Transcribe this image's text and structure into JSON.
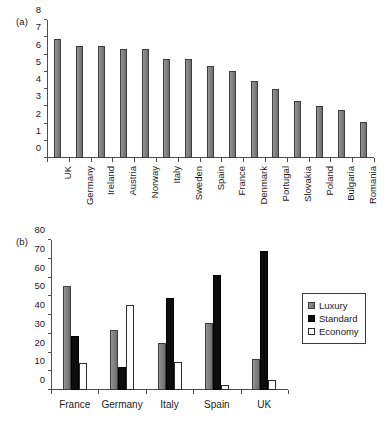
{
  "figure": {
    "background": "#ffffff",
    "bar_gray": "#808080",
    "bar_black": "#0d0d0d",
    "bar_white": "#ffffff",
    "axis_color": "#4d4d4d"
  },
  "panel_a": {
    "tag": "(a)"
  },
  "panel_b": {
    "tag": "(b)"
  },
  "legend": {
    "position": "right",
    "entries": [
      {
        "label": "Luxury",
        "color": "#808080"
      },
      {
        "label": "Standard",
        "color": "#0d0d0d"
      },
      {
        "label": "Economy",
        "color": "#ffffff"
      }
    ]
  },
  "chart_data": [
    {
      "id": "panel-a",
      "type": "bar",
      "title": "(a)",
      "xlabel": "",
      "ylabel": "",
      "ylim": [
        0,
        8
      ],
      "yticks": [
        0,
        1,
        2,
        3,
        4,
        5,
        6,
        7,
        8
      ],
      "ytick_labels": [
        "0",
        "1",
        "2",
        "3",
        "4",
        "5",
        "6",
        "7",
        "8"
      ],
      "grid": false,
      "legend": false,
      "label_rotation": -90,
      "categories": [
        "UK",
        "Germany",
        "Ireland",
        "Austria",
        "Norway",
        "Italy",
        "Sweden",
        "Spain",
        "France",
        "Denmark",
        "Portugal",
        "Slovakia",
        "Poland",
        "Bulgaria",
        "Romania"
      ],
      "values": [
        6.9,
        6.5,
        6.5,
        6.3,
        6.3,
        5.75,
        5.75,
        5.35,
        5.05,
        4.45,
        4.0,
        3.3,
        3.0,
        2.8,
        2.1
      ]
    },
    {
      "id": "panel-b",
      "type": "bar",
      "title": "(b)",
      "xlabel": "",
      "ylabel": "",
      "ylim": [
        0,
        80
      ],
      "yticks": [
        0,
        10,
        20,
        30,
        40,
        50,
        60,
        70,
        80
      ],
      "ytick_labels": [
        "0",
        "10",
        "20",
        "30",
        "40",
        "50",
        "60",
        "70",
        "80"
      ],
      "grid": false,
      "legend": true,
      "legend_position": "right",
      "categories": [
        "France",
        "Germany",
        "Italy",
        "Spain",
        "UK"
      ],
      "series": [
        {
          "name": "Luxury",
          "color": "#808080",
          "values": [
            55.5,
            32.0,
            25.3,
            36.0,
            16.7
          ]
        },
        {
          "name": "Standard",
          "color": "#0d0d0d",
          "values": [
            28.7,
            12.5,
            49.0,
            61.5,
            74.2
          ]
        },
        {
          "name": "Economy",
          "color": "#ffffff",
          "values": [
            14.2,
            45.5,
            15.0,
            2.5,
            5.2
          ]
        }
      ]
    }
  ]
}
